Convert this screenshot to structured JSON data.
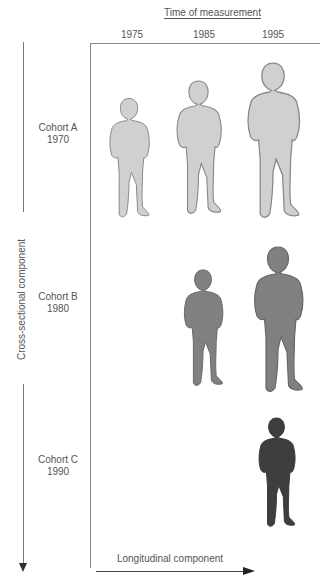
{
  "header": {
    "title": "Time of measurement",
    "years": [
      "1975",
      "1985",
      "1995"
    ]
  },
  "cohorts": [
    {
      "name": "Cohort A",
      "year": "1970",
      "color": "#d0d0d0"
    },
    {
      "name": "Cohort B",
      "year": "1980",
      "color": "#808080"
    },
    {
      "name": "Cohort C",
      "year": "1990",
      "color": "#3e3e3e"
    }
  ],
  "axes": {
    "vertical_label": "Cross-sectional component",
    "horizontal_label": "Longitudinal component"
  },
  "figures": [
    {
      "cohort": "Cohort A",
      "time": "1975",
      "size": "small"
    },
    {
      "cohort": "Cohort A",
      "time": "1985",
      "size": "medium"
    },
    {
      "cohort": "Cohort A",
      "time": "1995",
      "size": "large"
    },
    {
      "cohort": "Cohort B",
      "time": "1985",
      "size": "small"
    },
    {
      "cohort": "Cohort B",
      "time": "1995",
      "size": "large"
    },
    {
      "cohort": "Cohort C",
      "time": "1995",
      "size": "small"
    }
  ]
}
